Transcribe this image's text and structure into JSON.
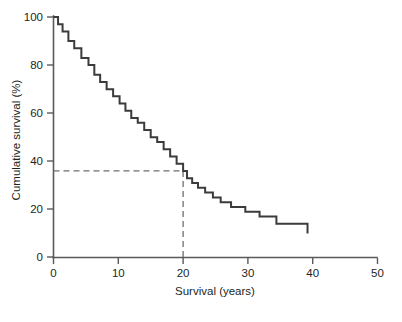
{
  "chart_data": {
    "type": "line",
    "subtype": "kaplan-meier-step",
    "title": "",
    "xlabel": "Survival (years)",
    "ylabel": "Cumulative survival (%)",
    "xlim": [
      0,
      50
    ],
    "ylim": [
      0,
      100
    ],
    "xticks": [
      0,
      10,
      20,
      30,
      40,
      50
    ],
    "xtick_labels": [
      "0",
      "10",
      "20",
      "30",
      "40",
      "50"
    ],
    "yticks": [
      0,
      20,
      40,
      60,
      80,
      100
    ],
    "ytick_labels": [
      "0",
      "20",
      "40",
      "60",
      "80",
      "100"
    ],
    "grid": false,
    "legend": false,
    "series": [
      {
        "name": "Cumulative survival",
        "step": "post",
        "color": "#3b3b3d",
        "x": [
          0.0,
          0.7,
          1.4,
          2.3,
          3.2,
          4.3,
          5.4,
          6.3,
          7.2,
          8.2,
          9.2,
          10.2,
          11.1,
          12.0,
          13.0,
          14.0,
          15.0,
          16.0,
          17.0,
          18.0,
          19.0,
          20.0,
          20.6,
          21.4,
          22.3,
          23.4,
          24.6,
          25.8,
          27.4,
          29.6,
          31.8,
          34.4,
          39.2
        ],
        "y": [
          100,
          97,
          94,
          90,
          87,
          83,
          80,
          76,
          73,
          70,
          67,
          64,
          61,
          58,
          56,
          53,
          50,
          48,
          45,
          42,
          39,
          36,
          33,
          31,
          29,
          27,
          25,
          23,
          21,
          19,
          17,
          14,
          10
        ]
      }
    ],
    "annotations": [
      {
        "name": "median-reference",
        "type": "dashed-crosshair",
        "x": 20,
        "y": 36,
        "style": "dashed",
        "color": "#6d6e71",
        "description": "Dashed lines from y-axis at 36% meeting the curve at 20 years, then dropping to the x-axis at 20."
      }
    ],
    "plateau": {
      "value": 10,
      "from_x": 34.4,
      "to_x": 39.2
    }
  },
  "caption": {
    "text": ""
  }
}
